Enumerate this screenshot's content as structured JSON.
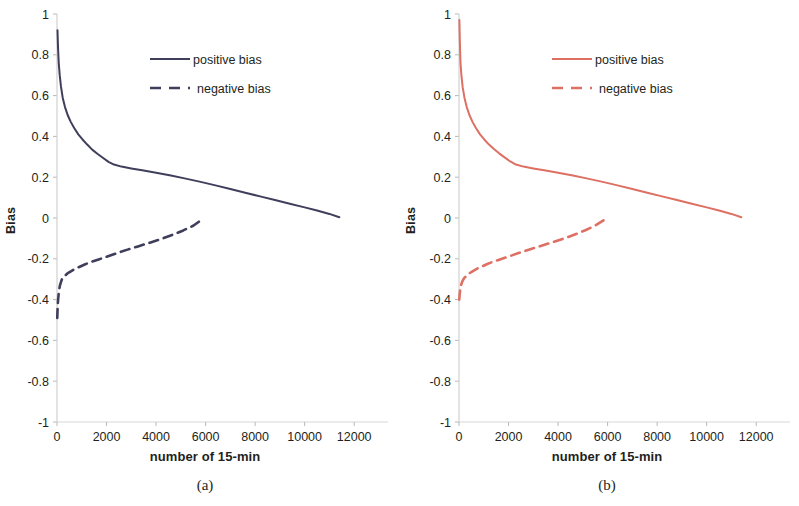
{
  "figure": {
    "panels": [
      {
        "caption": "(a)",
        "color": "#3f3f5c",
        "axis": {
          "ylabel": "Bias",
          "xlabel": "number of 15-min",
          "yticks": [
            "1",
            "0.8",
            "0.6",
            "0.4",
            "0.2",
            "0",
            "-0.2",
            "-0.4",
            "-0.6",
            "-0.8",
            "-1"
          ],
          "xticks": [
            "0",
            "2000",
            "4000",
            "6000",
            "8000",
            "10000",
            "12000"
          ]
        },
        "legend": {
          "positive_label": "positive bias",
          "negative_label": "negative bias"
        }
      },
      {
        "caption": "(b)",
        "color": "#dd6f63",
        "axis": {
          "ylabel": "Bias",
          "xlabel": "number of 15-min",
          "yticks": [
            "1",
            "0.8",
            "0.6",
            "0.4",
            "0.2",
            "0",
            "-0.2",
            "-0.4",
            "-0.6",
            "-0.8",
            "-1"
          ],
          "xticks": [
            "0",
            "2000",
            "4000",
            "6000",
            "8000",
            "10000",
            "12000"
          ]
        },
        "legend": {
          "positive_label": "positive bias",
          "negative_label": "negative bias"
        }
      }
    ]
  },
  "chart_data": [
    {
      "type": "line",
      "panel": "(a)",
      "title": "",
      "xlabel": "number of 15-min",
      "ylabel": "Bias",
      "xlim": [
        0,
        12800
      ],
      "ylim": [
        -1,
        1
      ],
      "xticks": [
        0,
        2000,
        4000,
        6000,
        8000,
        10000,
        12000
      ],
      "yticks": [
        -1,
        -0.8,
        -0.6,
        -0.4,
        -0.2,
        0,
        0.2,
        0.4,
        0.6,
        0.8,
        1
      ],
      "grid": false,
      "legend_position": "inside-upper-center",
      "color": "#3f3f5c",
      "series": [
        {
          "name": "positive bias",
          "style": "solid",
          "x": [
            20,
            40,
            70,
            110,
            160,
            230,
            320,
            430,
            560,
            700,
            860,
            1030,
            1220,
            1420,
            1630,
            1850,
            2080,
            2300,
            2600,
            3000,
            3500,
            4000,
            4600,
            5200,
            5800,
            6400,
            7000,
            7600,
            8200,
            8800,
            9400,
            10000,
            10500,
            11000,
            11400
          ],
          "y": [
            0.92,
            0.84,
            0.76,
            0.7,
            0.645,
            0.59,
            0.545,
            0.505,
            0.47,
            0.44,
            0.41,
            0.385,
            0.36,
            0.335,
            0.315,
            0.295,
            0.275,
            0.262,
            0.252,
            0.243,
            0.233,
            0.222,
            0.208,
            0.193,
            0.177,
            0.16,
            0.142,
            0.124,
            0.106,
            0.088,
            0.07,
            0.052,
            0.037,
            0.02,
            0.004
          ]
        },
        {
          "name": "negative bias",
          "style": "dashed",
          "x": [
            10,
            25,
            45,
            80,
            130,
            200,
            300,
            420,
            560,
            720,
            900,
            1120,
            1380,
            1680,
            2000,
            2400,
            2850,
            3300,
            3750,
            4200,
            4650,
            5100,
            5500,
            5800
          ],
          "y": [
            -0.49,
            -0.44,
            -0.4,
            -0.355,
            -0.325,
            -0.3,
            -0.285,
            -0.272,
            -0.262,
            -0.25,
            -0.24,
            -0.228,
            -0.215,
            -0.203,
            -0.19,
            -0.173,
            -0.155,
            -0.138,
            -0.121,
            -0.103,
            -0.083,
            -0.061,
            -0.038,
            -0.012
          ]
        }
      ]
    },
    {
      "type": "line",
      "panel": "(b)",
      "title": "",
      "xlabel": "number of 15-min",
      "ylabel": "Bias",
      "xlim": [
        0,
        12800
      ],
      "ylim": [
        -1,
        1
      ],
      "xticks": [
        0,
        2000,
        4000,
        6000,
        8000,
        10000,
        12000
      ],
      "yticks": [
        -1,
        -0.8,
        -0.6,
        -0.4,
        -0.2,
        0,
        0.2,
        0.4,
        0.6,
        0.8,
        1
      ],
      "grid": false,
      "legend_position": "inside-upper-center",
      "color": "#dd6f63",
      "series": [
        {
          "name": "positive bias",
          "style": "solid",
          "x": [
            15,
            35,
            60,
            100,
            150,
            220,
            310,
            420,
            550,
            690,
            850,
            1020,
            1210,
            1410,
            1620,
            1840,
            2070,
            2300,
            2600,
            3000,
            3500,
            4000,
            4600,
            5200,
            5800,
            6400,
            7000,
            7600,
            8200,
            8800,
            9400,
            10000,
            10500,
            11000,
            11400
          ],
          "y": [
            0.97,
            0.86,
            0.76,
            0.695,
            0.64,
            0.59,
            0.545,
            0.505,
            0.47,
            0.44,
            0.41,
            0.385,
            0.36,
            0.338,
            0.317,
            0.297,
            0.277,
            0.262,
            0.252,
            0.243,
            0.233,
            0.222,
            0.208,
            0.193,
            0.177,
            0.16,
            0.142,
            0.124,
            0.106,
            0.088,
            0.07,
            0.052,
            0.037,
            0.02,
            0.004
          ]
        },
        {
          "name": "negative bias",
          "style": "dashed",
          "x": [
            10,
            25,
            45,
            80,
            130,
            200,
            300,
            420,
            560,
            720,
            900,
            1120,
            1380,
            1680,
            2000,
            2400,
            2850,
            3300,
            3750,
            4200,
            4650,
            5100,
            5500,
            5850
          ],
          "y": [
            -0.4,
            -0.375,
            -0.355,
            -0.33,
            -0.312,
            -0.296,
            -0.283,
            -0.271,
            -0.26,
            -0.249,
            -0.239,
            -0.227,
            -0.214,
            -0.202,
            -0.189,
            -0.172,
            -0.154,
            -0.137,
            -0.12,
            -0.102,
            -0.082,
            -0.06,
            -0.037,
            -0.011
          ]
        }
      ]
    }
  ]
}
